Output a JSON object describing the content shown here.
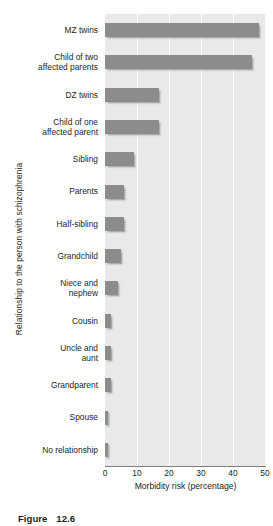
{
  "figure": {
    "caption_label": "Figure",
    "caption_number": "12.6"
  },
  "chart_data": {
    "type": "bar",
    "orientation": "horizontal",
    "title": "",
    "xlabel": "Morbidity risk (percentage)",
    "ylabel": "Relationship to the person with schizophrenia",
    "xlim": [
      0,
      50
    ],
    "xticks": [
      0,
      10,
      20,
      30,
      40,
      50
    ],
    "xtick_labels": [
      "0",
      "10",
      "20",
      "30",
      "40",
      "50"
    ],
    "grid": "vertical-white",
    "legend": "none",
    "bar_color": "#8c8c8c",
    "plot_background": "#e9e9e9",
    "categories": [
      "MZ twins",
      "Child of two affected parents",
      "DZ twins",
      "Child of one affected parent",
      "Sibling",
      "Parents",
      "Half-sibling",
      "Grandchild",
      "Niece and nephew",
      "Cousin",
      "Uncle and aunt",
      "Grandparent",
      "Spouse",
      "No relationship"
    ],
    "category_lines": [
      [
        "MZ twins"
      ],
      [
        "Child of two",
        "affected parents"
      ],
      [
        "DZ twins"
      ],
      [
        "Child of one",
        "affected parent"
      ],
      [
        "Sibling"
      ],
      [
        "Parents"
      ],
      [
        "Half-sibling"
      ],
      [
        "Grandchild"
      ],
      [
        "Niece and",
        "nephew"
      ],
      [
        "Cousin"
      ],
      [
        "Uncle and",
        "aunt"
      ],
      [
        "Grandparent"
      ],
      [
        "Spouse"
      ],
      [
        "No relationship"
      ]
    ],
    "values": [
      48,
      46,
      17,
      17,
      9,
      6,
      6,
      5,
      4,
      2,
      2,
      2,
      1,
      1
    ]
  }
}
